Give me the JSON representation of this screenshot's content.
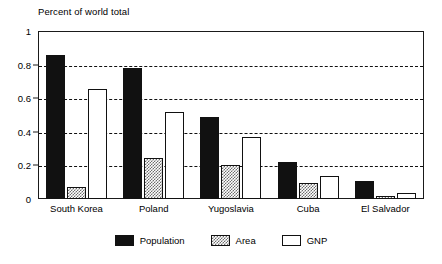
{
  "chart_data": {
    "type": "bar",
    "title": "Percent of world total",
    "xlabel": "",
    "ylabel": "",
    "ylim": [
      0,
      1
    ],
    "yticks": [
      "0",
      "0.2",
      "0.4",
      "0.6",
      "0.8",
      "1"
    ],
    "ytick_values": [
      0,
      0.2,
      0.4,
      0.6,
      0.8,
      1
    ],
    "grid": "horizontal-dashed",
    "legend_position": "bottom-center",
    "categories": [
      "South Korea",
      "Poland",
      "Yugoslavia",
      "Cuba",
      "El Salvador"
    ],
    "series": [
      {
        "name": "Population",
        "color": "#111111",
        "fill": "solid-black",
        "values": [
          0.855,
          0.78,
          0.49,
          0.22,
          0.11
        ]
      },
      {
        "name": "Area",
        "color": "#6e6e6e",
        "fill": "gray-checker-hatch",
        "values": [
          0.07,
          0.245,
          0.205,
          0.095,
          0.015
        ]
      },
      {
        "name": "GNP",
        "color": "#ffffff",
        "fill": "white-outline",
        "values": [
          0.655,
          0.52,
          0.37,
          0.135,
          0.035
        ]
      }
    ]
  },
  "legend": {
    "items": [
      {
        "label": "Population",
        "swatch": "population"
      },
      {
        "label": "Area",
        "swatch": "area"
      },
      {
        "label": "GNP",
        "swatch": "gnp"
      }
    ]
  },
  "colors": {
    "axis": "#1a1a1a",
    "grid": "#111111",
    "population": "#111111",
    "area": "#6e6e6e",
    "gnp": "#ffffff",
    "background": "#ffffff"
  }
}
